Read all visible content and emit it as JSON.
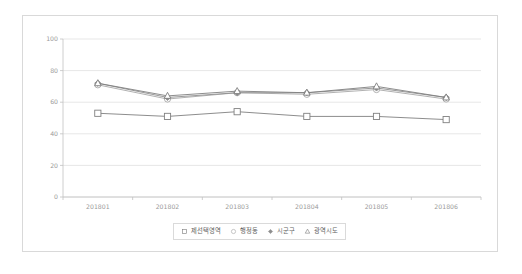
{
  "chart_data": {
    "type": "line",
    "title": "",
    "subtitle": "",
    "xlabel": "",
    "ylabel": "",
    "categories": [
      "201801",
      "201802",
      "201803",
      "201804",
      "201805",
      "201806"
    ],
    "ylim": [
      0,
      100
    ],
    "yticks": [
      0,
      20,
      40,
      60,
      80,
      100
    ],
    "grid": true,
    "legend_position": "bottom-center",
    "series": [
      {
        "name": "제선택영역",
        "marker": "square-open",
        "color": "#808080",
        "values": [
          53,
          51,
          54,
          51,
          51,
          49
        ]
      },
      {
        "name": "행정동",
        "marker": "circle-open",
        "color": "#a8a8a8",
        "values": [
          71,
          62,
          66,
          65,
          68,
          62
        ]
      },
      {
        "name": "시군구",
        "marker": "diamond-solid",
        "color": "#8e8e8e",
        "values": [
          72,
          63,
          66,
          66,
          69,
          63
        ]
      },
      {
        "name": "광역시도",
        "marker": "triangle-open",
        "color": "#7f7f7f",
        "values": [
          72,
          64,
          67,
          66,
          70,
          63
        ]
      }
    ]
  },
  "legend": {
    "entries": [
      {
        "label": "제선택영역",
        "marker": "square-open-icon"
      },
      {
        "label": "행정동",
        "marker": "circle-open-icon"
      },
      {
        "label": "시군구",
        "marker": "diamond-solid-icon"
      },
      {
        "label": "광역시도",
        "marker": "triangle-open-icon"
      }
    ]
  },
  "axis": {
    "y_tick_labels": [
      "0",
      "20",
      "40",
      "60",
      "80",
      "100"
    ],
    "x_tick_labels": [
      "201801",
      "201802",
      "201803",
      "201804",
      "201805",
      "201806"
    ]
  },
  "colors": {
    "card_border": "#d9d9d9",
    "gridline": "#dcdcdc",
    "axis": "#c2c2c2",
    "tick_text": "#9a9a9a",
    "legend_text": "#636363",
    "legend_border": "#dadada",
    "background": "#ffffff"
  }
}
